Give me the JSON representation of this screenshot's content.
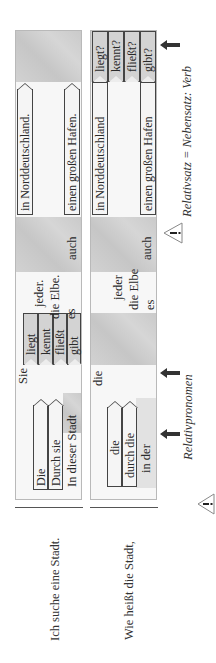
{
  "rows": [
    {
      "sentence": "Ich suche eine Stadt.",
      "subjects": [
        "Die",
        "Durch sie",
        "In dieser Stadt"
      ],
      "pronoun_slot": "Sie",
      "verbs": [
        "liegt",
        "kennt",
        "fließt",
        "gibt"
      ],
      "middle": [
        "jeder.",
        "die Elbe.",
        "es"
      ],
      "auch": "auch",
      "endings": [
        "in Norddeutschland.",
        "einen großen Hafen."
      ]
    },
    {
      "sentence": "Wie heißt die Stadt,",
      "subjects": [
        "die",
        "durch die",
        "in der"
      ],
      "pronoun_slot": "die",
      "verbs": [
        "liegt?",
        "kennt?",
        "fließt?",
        "gibt?"
      ],
      "middle": [
        "jeder",
        "die Elbe",
        "es"
      ],
      "auch": "auch",
      "endings": [
        "in Norddeutschland",
        "einen großen Hafen"
      ]
    }
  ],
  "annotations": {
    "relativpronomen": "Relativpronomen",
    "rule": "Relativsatz = Nebensatz: Verb",
    "warning_icon": "warning-triangle-icon",
    "arrow_icon": "left-pointing-arrow-icon"
  },
  "colors": {
    "shade": "#cfcfcf",
    "panel": "#f7f7f7",
    "border": "#444444",
    "text": "#2a2a2a"
  }
}
